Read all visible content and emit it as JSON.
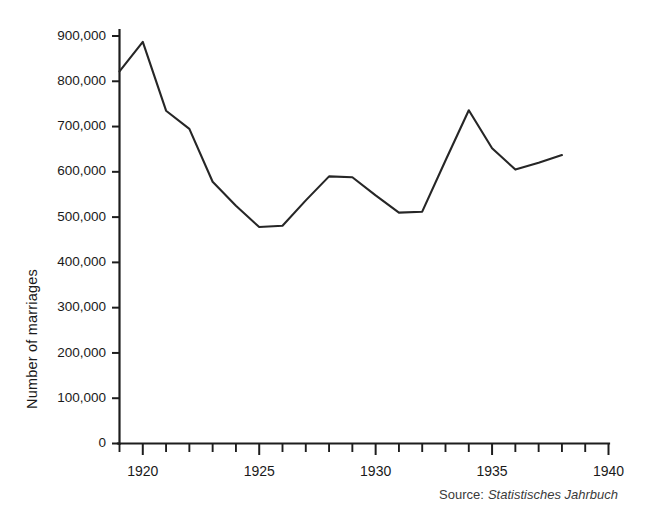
{
  "chart_data": {
    "type": "line",
    "title": "",
    "xlabel": "",
    "ylabel": "Number of marriages",
    "xlim": [
      1919,
      1940
    ],
    "ylim": [
      0,
      900000
    ],
    "grid": false,
    "legend": null,
    "source_label": "Source:",
    "source_title": "Statistisches Jahrbuch",
    "x_tick_labels": [
      "1920",
      "1925",
      "1930",
      "1935",
      "1940"
    ],
    "x_tick_values": [
      1920,
      1925,
      1930,
      1935,
      1940
    ],
    "x_minor_step": 1,
    "y_tick_labels": [
      "0",
      "100,000",
      "200,000",
      "300,000",
      "400,000",
      "500,000",
      "600,000",
      "700,000",
      "800,000",
      "900,000"
    ],
    "y_tick_values": [
      0,
      100000,
      200000,
      300000,
      400000,
      500000,
      600000,
      700000,
      800000,
      900000
    ],
    "x": [
      1919,
      1920,
      1921,
      1922,
      1923,
      1924,
      1925,
      1926,
      1927,
      1928,
      1929,
      1930,
      1931,
      1932,
      1933,
      1934,
      1935,
      1936,
      1937,
      1938
    ],
    "values": [
      822000,
      887000,
      735000,
      695000,
      578000,
      525000,
      478000,
      481000,
      537000,
      590000,
      588000,
      548000,
      510000,
      512000,
      625000,
      736000,
      652000,
      605000,
      620000,
      637000
    ],
    "series": [
      {
        "name": "Number of marriages",
        "color": "#262626",
        "x": [
          1919,
          1920,
          1921,
          1922,
          1923,
          1924,
          1925,
          1926,
          1927,
          1928,
          1929,
          1930,
          1931,
          1932,
          1933,
          1934,
          1935,
          1936,
          1937,
          1938
        ],
        "values": [
          822000,
          887000,
          735000,
          695000,
          578000,
          525000,
          478000,
          481000,
          537000,
          590000,
          588000,
          548000,
          510000,
          512000,
          625000,
          736000,
          652000,
          605000,
          620000,
          637000
        ]
      }
    ]
  },
  "colors": {
    "background": "#ffffff",
    "axis": "#1d1d1d",
    "line": "#262626",
    "text": "#1a1a1a"
  }
}
